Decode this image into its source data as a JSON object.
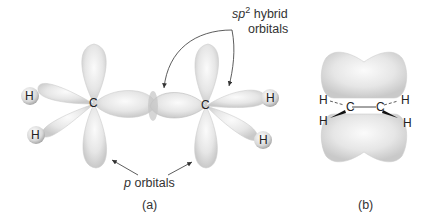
{
  "figure": {
    "panel_a": {
      "caption": "(a)",
      "label_sp2_prefix": "sp",
      "label_sp2_sup": "2",
      "label_sp2_rest": " hybrid",
      "label_sp2_line2": "orbitals",
      "label_p_prefix": "p",
      "label_p_rest": " orbitals",
      "atoms": {
        "c_left": "C",
        "c_right": "C",
        "h_left_top": "H",
        "h_left_bottom": "H",
        "h_right_top": "H",
        "h_right_bottom": "H"
      }
    },
    "panel_b": {
      "caption": "(b)",
      "atoms": {
        "c_left": "C",
        "c_right": "C",
        "h_tl": "H",
        "h_bl": "H",
        "h_tr": "H",
        "h_br": "H"
      }
    }
  }
}
